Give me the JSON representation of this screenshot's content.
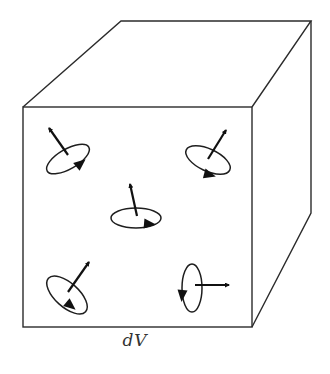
{
  "figure": {
    "label": "dV",
    "colors": {
      "background": "#ffffff",
      "line": "#2b2b2b",
      "arrow": "#111111"
    },
    "cube": {
      "front_face": {
        "x": 23,
        "y": 107,
        "width": 229,
        "height": 220
      },
      "back_top_left": [
        121,
        21
      ],
      "back_top_right": [
        311,
        21
      ],
      "back_bottom_right": [
        311,
        213
      ]
    },
    "spins": [
      {
        "name": "top-left",
        "ellipse": {
          "cx": 68,
          "cy": 159,
          "rx": 24,
          "ry": 10,
          "rotate": -30
        },
        "axis_from": [
          68,
          155
        ],
        "axis_to": [
          49,
          128
        ],
        "orbit_arrow": {
          "x": 81,
          "y": 163,
          "angle": -40
        }
      },
      {
        "name": "top-right",
        "ellipse": {
          "cx": 208,
          "cy": 160,
          "rx": 24,
          "ry": 11,
          "rotate": 25
        },
        "axis_from": [
          208,
          159
        ],
        "axis_to": [
          226,
          130
        ],
        "orbit_arrow": {
          "x": 210,
          "y": 175,
          "angle": 15
        }
      },
      {
        "name": "center",
        "ellipse": {
          "cx": 136,
          "cy": 218,
          "rx": 25,
          "ry": 10,
          "rotate": 0
        },
        "axis_from": [
          137,
          216
        ],
        "axis_to": [
          130,
          184
        ],
        "orbit_arrow": {
          "x": 150,
          "y": 224,
          "angle": 5
        }
      },
      {
        "name": "bottom-left",
        "ellipse": {
          "cx": 67,
          "cy": 295,
          "rx": 25,
          "ry": 12,
          "rotate": 42
        },
        "axis_from": [
          68,
          292
        ],
        "axis_to": [
          89,
          262
        ],
        "orbit_arrow": {
          "x": 71,
          "y": 306,
          "angle": 40
        }
      },
      {
        "name": "bottom-right",
        "ellipse": {
          "cx": 192,
          "cy": 288,
          "rx": 10,
          "ry": 24,
          "rotate": 0
        },
        "axis_from": [
          195,
          285
        ],
        "axis_to": [
          229,
          285
        ],
        "orbit_arrow": {
          "x": 182,
          "y": 296,
          "angle": 95
        }
      }
    ]
  }
}
